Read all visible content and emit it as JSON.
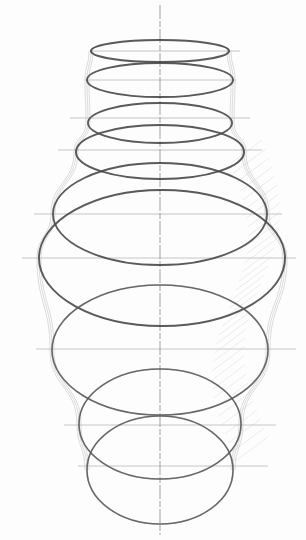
{
  "drawing": {
    "subject": "vase construction sketch",
    "medium": "pencil",
    "paper_color": "#fdfdfd",
    "stroke_colors": {
      "ellipse": "#5a5a5a",
      "ellipse_dark": "#4a4a4a",
      "axis": "#8a8a8a",
      "guide": "#b5b5b5",
      "contour": "#c8c8c8",
      "hatch": "#d8d8d8"
    },
    "axis": {
      "x": 160,
      "y1": 5,
      "y2": 535
    },
    "ellipses": [
      {
        "cx": 160,
        "cy": 51,
        "rx": 69,
        "ry": 11,
        "weight": 2.2
      },
      {
        "cx": 160,
        "cy": 80,
        "rx": 73,
        "ry": 17,
        "weight": 1.8
      },
      {
        "cx": 160,
        "cy": 123,
        "rx": 72,
        "ry": 20,
        "weight": 1.8
      },
      {
        "cx": 160,
        "cy": 152,
        "rx": 84,
        "ry": 27,
        "weight": 2.0
      },
      {
        "cx": 160,
        "cy": 214,
        "rx": 107,
        "ry": 51,
        "weight": 1.8
      },
      {
        "cx": 162,
        "cy": 258,
        "rx": 123,
        "ry": 68,
        "weight": 1.9
      },
      {
        "cx": 160,
        "cy": 350,
        "rx": 108,
        "ry": 65,
        "weight": 1.6
      },
      {
        "cx": 160,
        "cy": 424,
        "rx": 81,
        "ry": 55,
        "weight": 1.6
      },
      {
        "cx": 160,
        "cy": 470,
        "rx": 73,
        "ry": 54,
        "weight": 1.6
      }
    ],
    "guides": [
      {
        "y": 51,
        "x1": 90,
        "x2": 240
      },
      {
        "y": 80,
        "x1": 85,
        "x2": 236
      },
      {
        "y": 118,
        "x1": 70,
        "x2": 250
      },
      {
        "y": 150,
        "x1": 58,
        "x2": 262
      },
      {
        "y": 214,
        "x1": 34,
        "x2": 282
      },
      {
        "y": 258,
        "x1": 22,
        "x2": 296
      },
      {
        "y": 349,
        "x1": 36,
        "x2": 296
      },
      {
        "y": 425,
        "x1": 64,
        "x2": 276
      },
      {
        "y": 466,
        "x1": 78,
        "x2": 268
      }
    ]
  }
}
